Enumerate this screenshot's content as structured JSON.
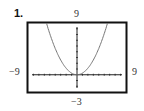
{
  "problem": {
    "number": "1."
  },
  "window_labels": {
    "ymax": "9",
    "xmin": "−9",
    "xmax": "9",
    "ymin": "−3"
  },
  "chart_data": {
    "type": "line",
    "title": "",
    "xlabel": "",
    "ylabel": "",
    "xlim": [
      -9,
      9
    ],
    "ylim": [
      -3,
      9
    ],
    "xscale": 1,
    "yscale": 1,
    "grid": false,
    "legend": null,
    "function": "y = x^2 / 3.5 (parabola, vertex at origin, opening upward)",
    "series": [
      {
        "name": "curve",
        "x": [
          -5.6,
          -5,
          -4,
          -3,
          -2,
          -1,
          0,
          1,
          2,
          3,
          4,
          5,
          5.6
        ],
        "y": [
          9.0,
          7.14,
          4.57,
          2.57,
          1.14,
          0.29,
          0,
          0.29,
          1.14,
          2.57,
          4.57,
          7.14,
          9.0
        ]
      }
    ],
    "tick_labels": {
      "x": [
        "−9",
        "9"
      ],
      "y": [
        "−3",
        "9"
      ]
    }
  },
  "colors": {
    "frame": "#111111",
    "axes": "#222222",
    "curve": "#777777",
    "background": "#ffffff"
  }
}
